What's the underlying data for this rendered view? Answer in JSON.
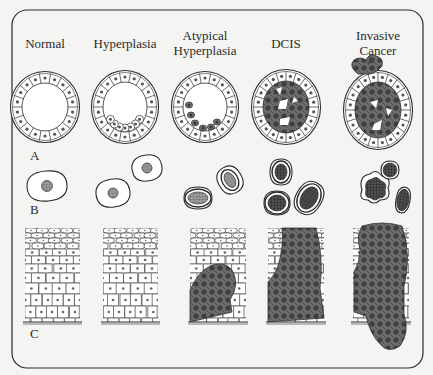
{
  "figure": {
    "columns": [
      {
        "id": "normal",
        "label_lines": [
          "Normal"
        ],
        "center_x": 45
      },
      {
        "id": "hyperplasia",
        "label_lines": [
          "Hyperplasia"
        ],
        "center_x": 125
      },
      {
        "id": "atypical-hyperplasia",
        "label_lines": [
          "Atypical",
          "Hyperplasia"
        ],
        "center_x": 205
      },
      {
        "id": "dcis",
        "label_lines": [
          "DCIS"
        ],
        "center_x": 286
      },
      {
        "id": "invasive-cancer",
        "label_lines": [
          "Invasive",
          "Cancer"
        ],
        "center_x": 378
      }
    ],
    "row_labels": {
      "a": "A",
      "b": "B",
      "c": "C"
    },
    "colors": {
      "background": "#f4f4f2",
      "line": "#2b2b2b",
      "cell_fill": "#ffffff",
      "nucleus_light": "#8a8a8a",
      "tumor_fill": "#6e6e6e",
      "tumor_dark": "#3a3a3a"
    }
  }
}
